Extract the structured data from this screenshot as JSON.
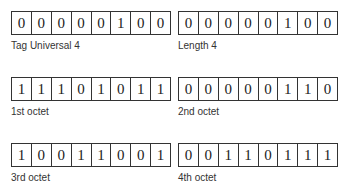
{
  "blocks": [
    {
      "label": "Tag Universal 4",
      "bits": [
        "0",
        "0",
        "0",
        "0",
        "0",
        "1",
        "0",
        "0"
      ]
    },
    {
      "label": "Length 4",
      "bits": [
        "0",
        "0",
        "0",
        "0",
        "0",
        "1",
        "0",
        "0"
      ]
    },
    {
      "label": "1st octet",
      "bits": [
        "1",
        "1",
        "1",
        "0",
        "1",
        "0",
        "1",
        "1"
      ]
    },
    {
      "label": "2nd octet",
      "bits": [
        "0",
        "0",
        "0",
        "0",
        "0",
        "1",
        "1",
        "0"
      ]
    },
    {
      "label": "3rd octet",
      "bits": [
        "1",
        "0",
        "0",
        "1",
        "1",
        "0",
        "0",
        "1"
      ]
    },
    {
      "label": "4th octet",
      "bits": [
        "0",
        "0",
        "1",
        "1",
        "0",
        "1",
        "1",
        "1"
      ]
    }
  ]
}
